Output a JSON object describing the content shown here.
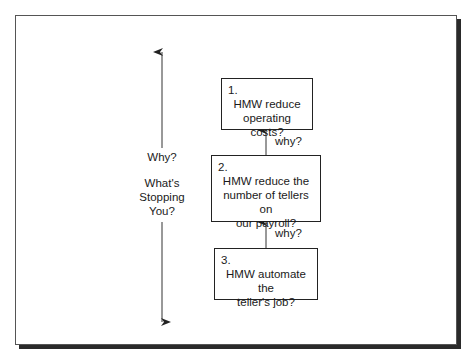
{
  "diagram": {
    "type": "flow",
    "side_axis": {
      "top_label": "Why?",
      "bottom_label_lines": [
        "What's",
        "Stopping",
        "You?"
      ]
    },
    "boxes": [
      {
        "number": "1.",
        "lines": [
          "HMW reduce",
          "operating costs?"
        ]
      },
      {
        "number": "2.",
        "lines": [
          "HMW reduce the",
          "number of tellers on",
          "our payroll?"
        ]
      },
      {
        "number": "3.",
        "lines": [
          "HMW automate the",
          "teller's job?"
        ]
      }
    ],
    "connectors": [
      {
        "from": 2,
        "to": 1,
        "label": "why?"
      },
      {
        "from": 3,
        "to": 2,
        "label": "why?"
      }
    ]
  }
}
